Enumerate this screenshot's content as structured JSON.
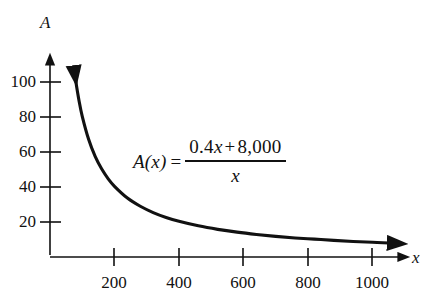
{
  "chart_data": {
    "type": "line",
    "title": "",
    "xlabel": "x",
    "ylabel": "A",
    "xlim": [
      0,
      1080
    ],
    "ylim": [
      0,
      112
    ],
    "grid": false,
    "legend": null,
    "xticks": [
      200,
      400,
      600,
      800,
      1000
    ],
    "xtick_labels": [
      "200",
      "400",
      "600",
      "800",
      "1000"
    ],
    "yticks": [
      20,
      40,
      60,
      80,
      100
    ],
    "ytick_labels": [
      "20",
      "40",
      "60",
      "80",
      "100"
    ],
    "annotations": [
      {
        "name": "function-formula",
        "text": "A(x) = (0.4x + 8,000) / x",
        "lhs": "A(x)",
        "equals": "=",
        "numerator": "0.4x + 8,000",
        "denominator": "x"
      }
    ],
    "series": [
      {
        "name": "A(x) = (0.4x + 8,000)/x",
        "color": "#111111",
        "arrow_start": true,
        "arrow_end": true,
        "x": [
          74,
          80,
          90,
          100,
          120,
          140,
          160,
          180,
          200,
          240,
          280,
          320,
          360,
          400,
          460,
          520,
          580,
          640,
          700,
          760,
          820,
          880,
          940,
          1000,
          1050
        ],
        "y": [
          108.5,
          100.4,
          89.3,
          80.4,
          67.1,
          57.5,
          50.4,
          44.8,
          40.4,
          33.7,
          28.99,
          25.4,
          22.6,
          20.4,
          17.8,
          15.8,
          14.2,
          12.9,
          11.8,
          10.9,
          10.2,
          9.5,
          8.9,
          8.4,
          8.0
        ]
      }
    ]
  },
  "axes": {
    "y_axis_label": "A",
    "x_axis_label": "x",
    "axis_color": "#111111"
  },
  "formula": {
    "lhs": "A(x)",
    "equals": "=",
    "numerator_a": "0.4",
    "numerator_x": "x",
    "numerator_plus": "+",
    "numerator_b": "8,000",
    "denominator": "x"
  }
}
